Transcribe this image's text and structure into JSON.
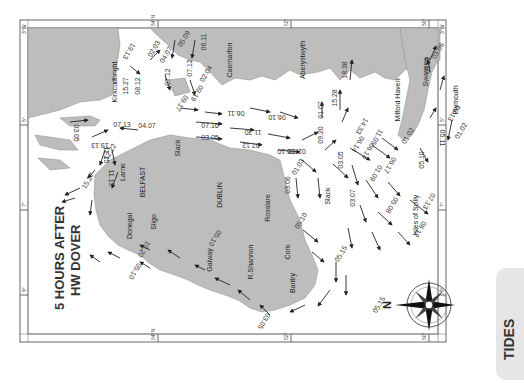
{
  "map": {
    "title_line1": "5 HOURS AFTER",
    "title_line2": "HW DOVER",
    "orientation_note": "rotated 90° clockwise; north points left",
    "compass": {
      "north_label": "N"
    },
    "side_tab": {
      "label": "TIDES",
      "color": "#e6e6e6"
    },
    "colors": {
      "land": "#bdbdbd",
      "sea": "#ffffff",
      "frame": "#666666",
      "text": "#333333"
    },
    "grid_labels": {
      "top": [
        "3°W",
        "54°N",
        "52°",
        "50°",
        "3°W"
      ],
      "bottom": [
        "54°N",
        "52°",
        "50°"
      ],
      "left": [
        "5°",
        "7°",
        "9°"
      ],
      "right": [
        "5°",
        "7°",
        "9°"
      ]
    },
    "places": [
      {
        "name": "Kirkcudbright",
        "x": 117,
        "y": 82,
        "rot": -90
      },
      {
        "name": "Caernarfon",
        "x": 232,
        "y": 60,
        "rot": -90
      },
      {
        "name": "Aberystwyth",
        "x": 305,
        "y": 60,
        "rot": -90
      },
      {
        "name": "Milford Haven",
        "x": 400,
        "y": 100,
        "rot": -90
      },
      {
        "name": "Swansea",
        "x": 428,
        "y": 72,
        "rot": -90
      },
      {
        "name": "Plymouth",
        "x": 458,
        "y": 100,
        "rot": -90
      },
      {
        "name": "Larne",
        "x": 125,
        "y": 172,
        "rot": -90
      },
      {
        "name": "BELFAST",
        "x": 145,
        "y": 182,
        "rot": -90
      },
      {
        "name": "Slack",
        "x": 180,
        "y": 148,
        "rot": -90
      },
      {
        "name": "DUBLIN",
        "x": 222,
        "y": 195,
        "rot": -90
      },
      {
        "name": "Rosslare",
        "x": 270,
        "y": 208,
        "rot": -90
      },
      {
        "name": "Slack",
        "x": 330,
        "y": 196,
        "rot": -90
      },
      {
        "name": "Isles of Scilly",
        "x": 418,
        "y": 215,
        "rot": -90
      },
      {
        "name": "Donegal",
        "x": 132,
        "y": 226,
        "rot": -90
      },
      {
        "name": "Sligo",
        "x": 156,
        "y": 222,
        "rot": -90
      },
      {
        "name": "Galway",
        "x": 212,
        "y": 260,
        "rot": -90
      },
      {
        "name": "R.Shannon",
        "x": 253,
        "y": 262,
        "rot": -90
      },
      {
        "name": "Cork",
        "x": 290,
        "y": 252,
        "rot": -90
      },
      {
        "name": "Bantry",
        "x": 295,
        "y": 283,
        "rot": -90
      }
    ],
    "stream_labels": [
      {
        "text": "03.05",
        "x": 74,
        "y": 133,
        "rot": 90
      },
      {
        "text": "07.13",
        "x": 122,
        "y": 127,
        "rot": 0
      },
      {
        "text": "04.07",
        "x": 147,
        "y": 128,
        "rot": 0
      },
      {
        "text": "19.13",
        "x": 100,
        "y": 143,
        "rot": 180
      },
      {
        "text": "11.15",
        "x": 104,
        "y": 155,
        "rot": 90
      },
      {
        "text": "12.22",
        "x": 112,
        "y": 153,
        "rot": -60
      },
      {
        "text": "11.19",
        "x": 109,
        "y": 178,
        "rot": 90
      },
      {
        "text": "15.27",
        "x": 90,
        "y": 182,
        "rot": -60
      },
      {
        "text": "15.27",
        "x": 128,
        "y": 86,
        "rot": -90
      },
      {
        "text": "08.12",
        "x": 140,
        "y": 86,
        "rot": -90
      },
      {
        "text": "19.13",
        "x": 127,
        "y": 50,
        "rot": 120
      },
      {
        "text": "02.03",
        "x": 156,
        "y": 50,
        "rot": -60
      },
      {
        "text": "04.07",
        "x": 168,
        "y": 56,
        "rot": -60
      },
      {
        "text": "05.09",
        "x": 186,
        "y": 40,
        "rot": -60
      },
      {
        "text": "07.12",
        "x": 170,
        "y": 77,
        "rot": -90
      },
      {
        "text": "07.12",
        "x": 192,
        "y": 68,
        "rot": -90
      },
      {
        "text": "06.11",
        "x": 206,
        "y": 42,
        "rot": -90
      },
      {
        "text": "02.04",
        "x": 208,
        "y": 75,
        "rot": -60
      },
      {
        "text": "09.19",
        "x": 195,
        "y": 92,
        "rot": 120
      },
      {
        "text": "09.17",
        "x": 180,
        "y": 102,
        "rot": 120
      },
      {
        "text": "06.11",
        "x": 236,
        "y": 111,
        "rot": 180
      },
      {
        "text": "06.10",
        "x": 277,
        "y": 115,
        "rot": 180
      },
      {
        "text": "07.16",
        "x": 210,
        "y": 128,
        "rot": 0
      },
      {
        "text": "11.30",
        "x": 253,
        "y": 130,
        "rot": 180
      },
      {
        "text": "03.05",
        "x": 210,
        "y": 140,
        "rot": 0
      },
      {
        "text": "07.12",
        "x": 251,
        "y": 143,
        "rot": 180
      },
      {
        "text": "02.03",
        "x": 297,
        "y": 149,
        "rot": 180
      },
      {
        "text": "05.10",
        "x": 286,
        "y": 149,
        "rot": 180
      },
      {
        "text": "01.07",
        "x": 323,
        "y": 110,
        "rot": -90
      },
      {
        "text": "15.28",
        "x": 337,
        "y": 98,
        "rot": -90
      },
      {
        "text": "18.38",
        "x": 347,
        "y": 70,
        "rot": -90
      },
      {
        "text": "09.20",
        "x": 323,
        "y": 135,
        "rot": -90
      },
      {
        "text": "14.33",
        "x": 360,
        "y": 125,
        "rot": 120
      },
      {
        "text": "06.14",
        "x": 356,
        "y": 143,
        "rot": 120
      },
      {
        "text": "11.05",
        "x": 375,
        "y": 136,
        "rot": 120
      },
      {
        "text": "01.03",
        "x": 300,
        "y": 168,
        "rot": -60
      },
      {
        "text": "03.06",
        "x": 290,
        "y": 185,
        "rot": -90
      },
      {
        "text": "03.05",
        "x": 343,
        "y": 160,
        "rot": -90
      },
      {
        "text": "06.14",
        "x": 366,
        "y": 150,
        "rot": 120
      },
      {
        "text": "06.17",
        "x": 388,
        "y": 164,
        "rot": 120
      },
      {
        "text": "01.09",
        "x": 374,
        "y": 172,
        "rot": 120
      },
      {
        "text": "01.02",
        "x": 410,
        "y": 137,
        "rot": -60
      },
      {
        "text": "05.10",
        "x": 424,
        "y": 160,
        "rot": -90
      },
      {
        "text": "03.07",
        "x": 355,
        "y": 198,
        "rot": -90
      },
      {
        "text": "05.08",
        "x": 390,
        "y": 204,
        "rot": 120
      },
      {
        "text": "07.13",
        "x": 427,
        "y": 200,
        "rot": 120
      },
      {
        "text": "08.12",
        "x": 418,
        "y": 228,
        "rot": 120
      },
      {
        "text": "01.02",
        "x": 430,
        "y": 65,
        "rot": -90
      },
      {
        "text": "03.06",
        "x": 440,
        "y": 52,
        "rot": -60
      },
      {
        "text": "06.13",
        "x": 452,
        "y": 112,
        "rot": 120
      },
      {
        "text": "01.02",
        "x": 463,
        "y": 132,
        "rot": -60
      },
      {
        "text": "05.11",
        "x": 440,
        "y": 138,
        "rot": 90
      },
      {
        "text": "05.10",
        "x": 303,
        "y": 222,
        "rot": -60
      },
      {
        "text": "05.15",
        "x": 343,
        "y": 255,
        "rot": -60
      },
      {
        "text": "05.15",
        "x": 381,
        "y": 306,
        "rot": -60
      },
      {
        "text": "03.05",
        "x": 262,
        "y": 320,
        "rot": 120
      },
      {
        "text": "10.20",
        "x": 142,
        "y": 248,
        "rot": 120
      },
      {
        "text": "05.10",
        "x": 133,
        "y": 270,
        "rot": 120
      },
      {
        "text": "05.10",
        "x": 213,
        "y": 237,
        "rot": 120
      }
    ]
  }
}
